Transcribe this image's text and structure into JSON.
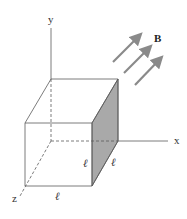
{
  "diagram": {
    "axes": {
      "x_label": "x",
      "y_label": "y",
      "z_label": "z"
    },
    "field": {
      "label": "B",
      "arrow_count": 3,
      "arrow_color": "#8a8a8a"
    },
    "cube": {
      "edge_label": "ℓ",
      "edge_labels": [
        "ℓ",
        "ℓ",
        "ℓ"
      ],
      "shaded_face": "right face (x = ℓ)",
      "shaded_color": "#a9a9a9",
      "line_color": "#5a5a5a"
    }
  }
}
